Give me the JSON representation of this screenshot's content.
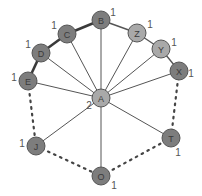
{
  "diagram": {
    "type": "graph",
    "colors": {
      "node_dark": "#7d7d7d",
      "node_light": "#a9a9a9",
      "node_stroke": "#555555",
      "edge": "#555555",
      "label": "#555555"
    },
    "nodes": [
      {
        "id": "A",
        "label": "A",
        "x": 101,
        "y": 98,
        "shade": "light",
        "degree_label": "2",
        "dl_dx": -12,
        "dl_dy": 7
      },
      {
        "id": "B",
        "label": "B",
        "x": 101,
        "y": 20,
        "shade": "dark",
        "degree_label": "1",
        "dl_dx": 12,
        "dl_dy": -8
      },
      {
        "id": "C",
        "label": "C",
        "x": 67,
        "y": 34,
        "shade": "dark",
        "degree_label": "1",
        "dl_dx": -13,
        "dl_dy": -9
      },
      {
        "id": "D",
        "label": "D",
        "x": 41,
        "y": 53,
        "shade": "dark",
        "degree_label": "1",
        "dl_dx": -13,
        "dl_dy": -9
      },
      {
        "id": "E",
        "label": "E",
        "x": 28,
        "y": 81,
        "shade": "dark",
        "degree_label": "1",
        "dl_dx": -14,
        "dl_dy": -4
      },
      {
        "id": "Z",
        "label": "Z",
        "x": 137,
        "y": 33,
        "shade": "light",
        "degree_label": "1",
        "dl_dx": 13,
        "dl_dy": -9
      },
      {
        "id": "Y",
        "label": "Y",
        "x": 161,
        "y": 49,
        "shade": "light",
        "degree_label": "1",
        "dl_dx": 13,
        "dl_dy": -7
      },
      {
        "id": "X",
        "label": "X",
        "x": 179,
        "y": 71,
        "shade": "dark",
        "degree_label": "1",
        "dl_dx": 12,
        "dl_dy": 2
      },
      {
        "id": "J",
        "label": "J",
        "x": 36,
        "y": 146,
        "shade": "dark",
        "degree_label": "1",
        "dl_dx": -14,
        "dl_dy": -3
      },
      {
        "id": "O",
        "label": "O",
        "x": 101,
        "y": 176,
        "shade": "dark",
        "degree_label": "1",
        "dl_dx": 13,
        "dl_dy": 9
      },
      {
        "id": "T",
        "label": "T",
        "x": 171,
        "y": 138,
        "shade": "dark",
        "degree_label": "1",
        "dl_dx": 7,
        "dl_dy": 14
      }
    ],
    "edges": [
      {
        "from": "B",
        "to": "C",
        "style": "thick"
      },
      {
        "from": "C",
        "to": "D",
        "style": "thick"
      },
      {
        "from": "D",
        "to": "E",
        "style": "thick"
      },
      {
        "from": "B",
        "to": "Z",
        "style": "solid"
      },
      {
        "from": "Z",
        "to": "Y",
        "style": "solid"
      },
      {
        "from": "Y",
        "to": "X",
        "style": "solid"
      },
      {
        "from": "A",
        "to": "B",
        "style": "thin"
      },
      {
        "from": "A",
        "to": "C",
        "style": "thin"
      },
      {
        "from": "A",
        "to": "D",
        "style": "thin"
      },
      {
        "from": "A",
        "to": "E",
        "style": "thin"
      },
      {
        "from": "A",
        "to": "Z",
        "style": "thin"
      },
      {
        "from": "A",
        "to": "Y",
        "style": "thin"
      },
      {
        "from": "A",
        "to": "X",
        "style": "thin"
      },
      {
        "from": "A",
        "to": "J",
        "style": "thin"
      },
      {
        "from": "A",
        "to": "O",
        "style": "thin"
      },
      {
        "from": "A",
        "to": "T",
        "style": "thin"
      },
      {
        "from": "E",
        "to": "J",
        "style": "dotted"
      },
      {
        "from": "J",
        "to": "O",
        "style": "dotted"
      },
      {
        "from": "O",
        "to": "T",
        "style": "dotted"
      },
      {
        "from": "T",
        "to": "X",
        "style": "dotted"
      }
    ],
    "node_radius": 9
  }
}
